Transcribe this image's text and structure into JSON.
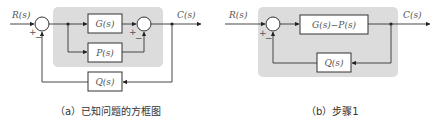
{
  "colors": {
    "group_fill": "#dcdcdc",
    "line": "#333333",
    "label": "#555555"
  },
  "diagram_a": {
    "input_label": "R(s)",
    "output_label": "C(s)",
    "blocks": {
      "g": "G(s)",
      "p": "P(s)",
      "q": "Q(s)"
    },
    "summer1_signs": {
      "plus": "+",
      "minus": "−"
    },
    "summer2_signs": {
      "plus": "+",
      "minus": "−"
    },
    "caption": "（a）已知问题的方框图"
  },
  "diagram_b": {
    "input_label": "R(s)",
    "output_label": "C(s)",
    "blocks": {
      "gp": "G(s)−P(s)",
      "q": "Q(s)"
    },
    "summer_signs": {
      "plus": "+",
      "minus": "−"
    },
    "caption": "（b）步骤1"
  }
}
